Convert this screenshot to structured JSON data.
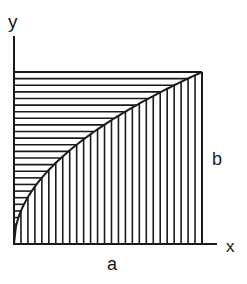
{
  "diagram": {
    "type": "area-partition",
    "labels": {
      "y_axis": "y",
      "x_axis": "x",
      "width": "a",
      "height": "b"
    },
    "colors": {
      "ink": "#1a1a1a",
      "background": "#ffffff"
    },
    "hatching": {
      "upper_region": "horizontal",
      "lower_region": "vertical",
      "horizontal_line_count": 26,
      "vertical_line_count": 27
    }
  }
}
